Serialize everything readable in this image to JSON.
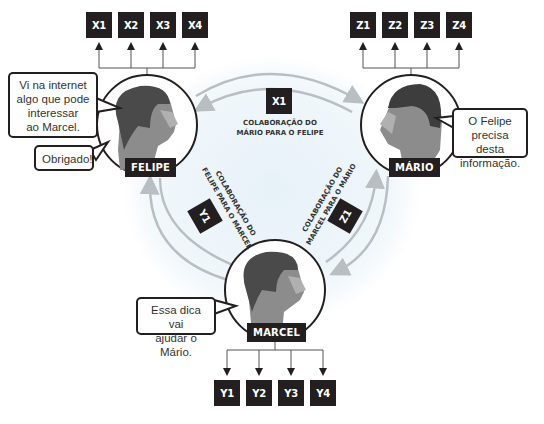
{
  "people": {
    "felipe": {
      "name": "FELIPE",
      "speech_main": [
        "Vi na internet",
        "algo que pode",
        "interessar",
        "ao Marcel."
      ],
      "speech_reply": "Obrigado!",
      "outputs": [
        "X1",
        "X2",
        "X3",
        "X4"
      ]
    },
    "mario": {
      "name": "MÁRIO",
      "speech_main": [
        "O Felipe",
        "precisa desta",
        "informação."
      ],
      "outputs": [
        "Z1",
        "Z2",
        "Z3",
        "Z4"
      ]
    },
    "marcel": {
      "name": "MARCEL",
      "speech_main": [
        "Essa dica vai",
        "ajudar o Mário."
      ],
      "outputs": [
        "Y1",
        "Y2",
        "Y3",
        "Y4"
      ]
    }
  },
  "collaborations": {
    "mario_to_felipe": {
      "token": "X1",
      "label_line1": "COLABORAÇÃO DO",
      "label_line2": "MÁRIO PARA O FELIPE"
    },
    "felipe_to_marcel": {
      "token": "Y1",
      "label_line1": "COLABORAÇÃO DO",
      "label_line2": "FELIPE PARA O MARCEL"
    },
    "marcel_to_mario": {
      "token": "Z1",
      "label_line1": "COLABORAÇÃO DO",
      "label_line2": "MARCEL PARA O MÁRIO"
    }
  },
  "colors": {
    "box": "#231f20",
    "arrow": "#b9bec3",
    "background_glow": "#eef5fa",
    "face_dark": "#4a4a4a",
    "face_mid": "#8c8c8c",
    "face_light": "#b0b0b0"
  }
}
